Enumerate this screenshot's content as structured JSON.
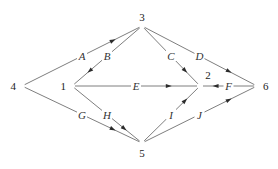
{
  "diagram": {
    "type": "directed-network",
    "nodes": [
      {
        "id": "1",
        "label": "1",
        "x": 72,
        "y": 86
      },
      {
        "id": "2",
        "label": "2",
        "x": 200,
        "y": 86,
        "label_x": 208,
        "label_y": 75
      },
      {
        "id": "3",
        "label": "3",
        "x": 142,
        "y": 26
      },
      {
        "id": "4",
        "label": "4",
        "x": 22,
        "y": 86
      },
      {
        "id": "5",
        "label": "5",
        "x": 142,
        "y": 143
      },
      {
        "id": "6",
        "label": "6",
        "x": 257,
        "y": 86
      }
    ],
    "edges": [
      {
        "id": "A",
        "label": "A",
        "from": "4",
        "to": "3"
      },
      {
        "id": "B",
        "label": "B",
        "from": "3",
        "to": "1"
      },
      {
        "id": "C",
        "label": "C",
        "from": "3",
        "to": "2"
      },
      {
        "id": "D",
        "label": "D",
        "from": "3",
        "to": "6"
      },
      {
        "id": "E",
        "label": "E",
        "from": "1",
        "to": "2"
      },
      {
        "id": "F",
        "label": "F",
        "from": "6",
        "to": "2"
      },
      {
        "id": "G",
        "label": "G",
        "from": "4",
        "to": "5"
      },
      {
        "id": "H",
        "label": "H",
        "from": "1",
        "to": "5"
      },
      {
        "id": "I",
        "label": "I",
        "from": "5",
        "to": "2"
      },
      {
        "id": "J",
        "label": "J",
        "from": "5",
        "to": "6"
      }
    ]
  }
}
